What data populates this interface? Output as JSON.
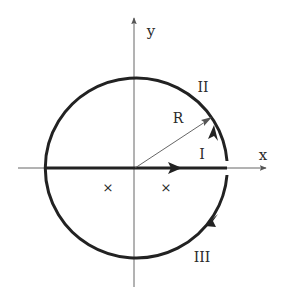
{
  "diagram": {
    "axes": {
      "x_label": "x",
      "y_label": "y",
      "origin": [
        135,
        168
      ],
      "x_range_px": [
        18,
        268
      ],
      "y_range_px": [
        16,
        287
      ]
    },
    "circle": {
      "center": [
        135,
        168
      ],
      "radius_px": 90,
      "radius_label": "R"
    },
    "segments": [
      {
        "id": "I",
        "label": "I",
        "description": "real-axis segment, directed toward +x"
      },
      {
        "id": "II",
        "label": "II",
        "description": "upper arc, counter-clockwise"
      },
      {
        "id": "III",
        "label": "III",
        "description": "lower arc, clockwise"
      }
    ],
    "markers": [
      {
        "symbol": "×",
        "position": [
          108,
          188
        ]
      },
      {
        "symbol": "×",
        "position": [
          166,
          188
        ]
      }
    ],
    "colors": {
      "contour": "#222222",
      "axes": "#555555",
      "background": "#ffffff"
    }
  }
}
